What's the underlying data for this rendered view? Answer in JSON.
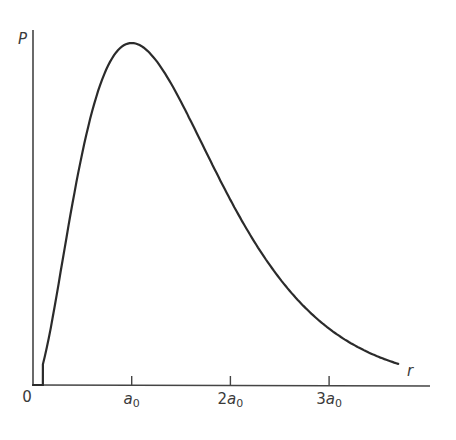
{
  "chart_data": {
    "type": "line",
    "title": "",
    "xlabel": "r",
    "ylabel": "P",
    "function": "P(r) proportional to r^2 exp(-2r/a0), normalized to peak = 1 at r = a0",
    "x_unit": "a0",
    "x_ticks": [
      {
        "value": 0,
        "label": "0",
        "coef": "0",
        "sym": "",
        "sub": ""
      },
      {
        "value": 1,
        "label": "a0",
        "coef": "",
        "sym": "a",
        "sub": "0"
      },
      {
        "value": 2,
        "label": "2a0",
        "coef": "2",
        "sym": "a",
        "sub": "0"
      },
      {
        "value": 3,
        "label": "3a0",
        "coef": "3",
        "sym": "a",
        "sub": "0"
      }
    ],
    "xlim": [
      0,
      4.0
    ],
    "ylim": [
      0,
      1.04
    ],
    "grid": false,
    "legend": null,
    "series": [
      {
        "name": "P(r)",
        "x": [
          0,
          0.1,
          0.25,
          0.5,
          0.75,
          1.0,
          1.25,
          1.5,
          1.75,
          2.0,
          2.5,
          3.0,
          3.5,
          3.7
        ],
        "values": [
          0,
          0.06,
          0.14,
          0.68,
          0.94,
          1.0,
          0.95,
          0.83,
          0.69,
          0.54,
          0.31,
          0.17,
          0.08,
          0.06
        ]
      }
    ],
    "peak": {
      "x": 1.0,
      "label": "a0",
      "value": 1.0
    }
  },
  "labels": {
    "y_axis": "P",
    "x_axis": "r",
    "origin": "0"
  },
  "colors": {
    "ink": "#2b2b2b",
    "background": "#ffffff"
  }
}
